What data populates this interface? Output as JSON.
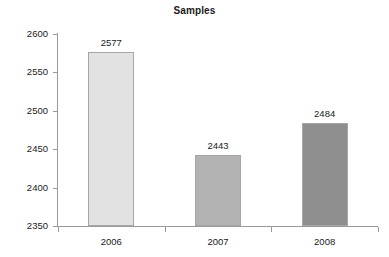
{
  "chart_data": {
    "type": "bar",
    "title": "Samples",
    "xlabel": "",
    "ylabel": "",
    "categories": [
      "2006",
      "2007",
      "2008"
    ],
    "values": [
      2577,
      2443,
      2484
    ],
    "data_labels": [
      "2577",
      "2443",
      "2484"
    ],
    "ylim": [
      2350,
      2600
    ],
    "ytick_step": 50,
    "ytick_labels": [
      "2350",
      "2400",
      "2450",
      "2500",
      "2550",
      "2600"
    ],
    "ytick_values": [
      2350,
      2400,
      2450,
      2500,
      2550,
      2600
    ],
    "grid": false,
    "legend": null,
    "bar_colors": [
      "#e2e2e2",
      "#b3b3b3",
      "#8f8f8f"
    ],
    "bar_border_color": "#a6a6a6",
    "axis_color": "#9a9a9a",
    "text_color": "#1a1a1a",
    "background": "#ffffff"
  }
}
